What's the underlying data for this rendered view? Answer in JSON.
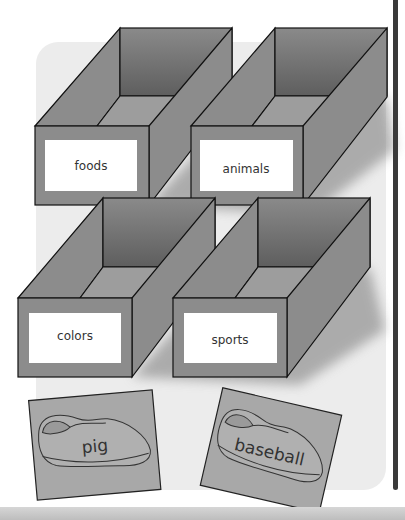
{
  "boxes": [
    {
      "label": "foods"
    },
    {
      "label": "animals"
    },
    {
      "label": "colors"
    },
    {
      "label": "sports"
    }
  ],
  "cards": [
    {
      "word": "pig",
      "icon": "shoe-icon"
    },
    {
      "word": "baseball",
      "icon": "shoe-icon"
    }
  ],
  "colors": {
    "box_face": "#8c8c8c",
    "box_inner": "#6e6e6e",
    "panel": "#ececec",
    "card": "#a8a8a8",
    "divider": "#3a3a3a"
  }
}
